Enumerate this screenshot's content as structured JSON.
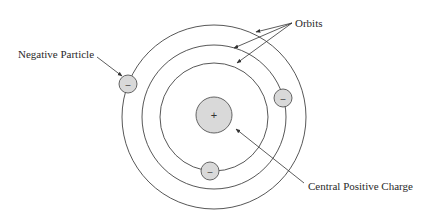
{
  "diagram": {
    "title": "",
    "type": "atomic model",
    "labels": {
      "orbits": "Orbits",
      "negative_particle": "Negative Particle",
      "central_positive_charge": "Central Positive Charge"
    },
    "nucleus": {
      "sign": "+",
      "fill": "#d9d9d9"
    },
    "electrons": [
      {
        "sign": "–",
        "orbit": "outer",
        "position": "upper-left"
      },
      {
        "sign": "–",
        "orbit": "middle",
        "position": "right"
      },
      {
        "sign": "–",
        "orbit": "inner",
        "position": "bottom"
      }
    ],
    "orbits": [
      "inner",
      "middle",
      "outer"
    ],
    "colors": {
      "stroke": "#444444",
      "particle_fill": "#d9d9d9",
      "text": "#2a2a2a"
    }
  }
}
